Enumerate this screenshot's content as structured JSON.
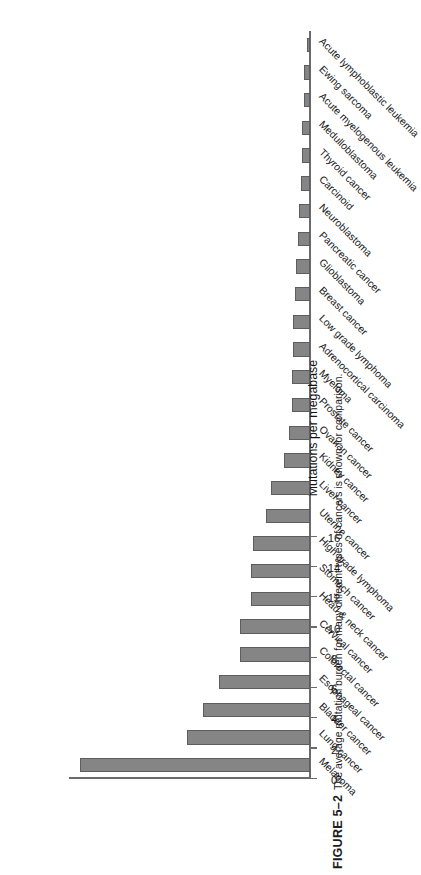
{
  "figure": {
    "label": "FIGURE 5–2",
    "caption": "The average mutation burden for many different types of cancers is shown for comparison."
  },
  "chart_data": {
    "type": "bar",
    "orientation": "vertical",
    "title": "",
    "subtitle": "",
    "xlabel": "",
    "ylabel": "Mutations per megabase",
    "ylim": [
      0,
      16
    ],
    "yticks": [
      0,
      2,
      4,
      6,
      8,
      10,
      12,
      14,
      16
    ],
    "grid": false,
    "legend": null,
    "bar_color": "#858585",
    "bar_edge_color": "#5d5d5d",
    "axis_color": "#6b6b6b",
    "categories": [
      "Melanoma",
      "Lung cancer",
      "Bladder cancer",
      "Esophageal cancer",
      "Colorectal cancer",
      "Cervical cancer",
      "Head & neck cancer",
      "Stomach cancer",
      "High grade lymphoma",
      "Uterine cancer",
      "Liver cancer",
      "Kidney cancer",
      "Ovarian cancer",
      "Prostate cancer",
      "Myeloma",
      "Adrenocortical carcinoma",
      "Low grade lymphoma",
      "Breast cancer",
      "Glioblastoma",
      "Pancreatic cancer",
      "Neuroblastoma",
      "Carcinoid",
      "Thyroid cancer",
      "Medulloblastoma",
      "Acute myelogenous leukemia",
      "Ewing sarcoma",
      "Acute lymphoblastic leukemia"
    ],
    "values": [
      15.2,
      8.1,
      7.1,
      6.0,
      4.6,
      4.6,
      3.9,
      3.9,
      3.8,
      2.9,
      2.6,
      1.7,
      1.4,
      1.2,
      1.2,
      1.1,
      1.1,
      1.0,
      0.9,
      0.8,
      0.7,
      0.6,
      0.5,
      0.5,
      0.4,
      0.4,
      0.2
    ]
  }
}
